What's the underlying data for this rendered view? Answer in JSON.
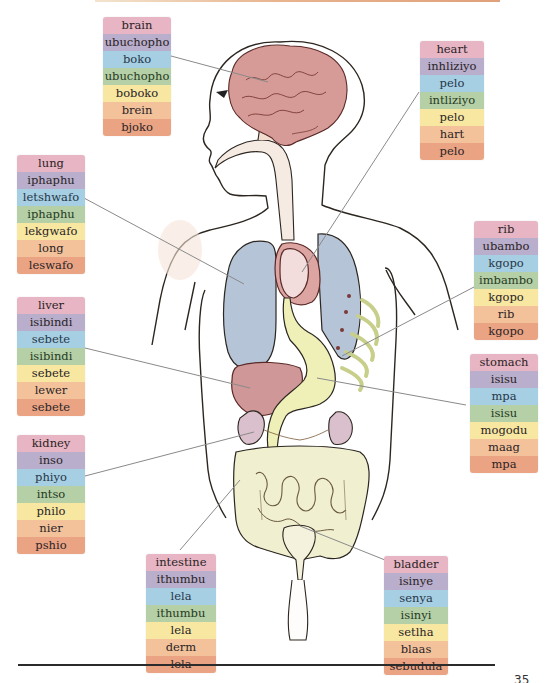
{
  "diagram": {
    "row_colors": [
      "#e7b5c3",
      "#b9aecb",
      "#a7cfe3",
      "#b5cfa6",
      "#f7e7a0",
      "#f3c29a",
      "#eaa383"
    ],
    "labels": {
      "brain": [
        "brain",
        "ubuchopho",
        "boko",
        "ubuchopho",
        "boboko",
        "brein",
        "bjoko"
      ],
      "heart": [
        "heart",
        "inhliziyo",
        "pelo",
        "intliziyo",
        "pelo",
        "hart",
        "pelo"
      ],
      "lung": [
        "lung",
        "iphaphu",
        "letshwafo",
        "iphaphu",
        "lekgwafo",
        "long",
        "leswafo"
      ],
      "rib": [
        "rib",
        "ubambo",
        "kgopo",
        "imbambo",
        "kgopo",
        "rib",
        "kgopo"
      ],
      "liver": [
        "liver",
        "isibindi",
        "sebete",
        "isibindi",
        "sebete",
        "lewer",
        "sebete"
      ],
      "stomach": [
        "stomach",
        "isisu",
        "mpa",
        "isisu",
        "mogodu",
        "maag",
        "mpa"
      ],
      "kidney": [
        "kidney",
        "inso",
        "phiyo",
        "intso",
        "philo",
        "nier",
        "pshio"
      ],
      "intestine": [
        "intestine",
        "ithumbu",
        "lela",
        "ithumbu",
        "lela",
        "derm",
        "lela"
      ],
      "bladder": [
        "bladder",
        "isinye",
        "senya",
        "isinyi",
        "setlha",
        "blaas",
        "sebudula"
      ]
    },
    "organ_colors": {
      "brain": "#d9a0a0",
      "lung": "#b5c3d8",
      "heart": "#d9a5a5",
      "liver": "#cf9797",
      "stomach": "#eef0b8",
      "kidney": "#d8bcc8",
      "intestine": "#f0efd0",
      "rib": "#e8ecb8",
      "skin_outline": "#2c2620"
    }
  },
  "page": {
    "number": "35"
  }
}
